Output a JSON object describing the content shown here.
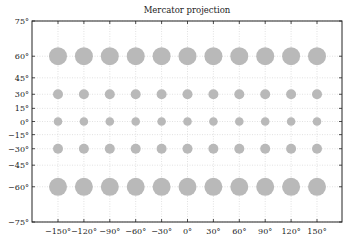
{
  "chart_data": {
    "type": "scatter",
    "title": "Mercator projection",
    "xlabel": "",
    "ylabel": "",
    "projection": "mercator",
    "xlim": [
      -180,
      180
    ],
    "ylim": [
      -75,
      75
    ],
    "grid": true,
    "grid_style": "dotted",
    "x_ticks": [
      -150,
      -120,
      -90,
      -60,
      -30,
      0,
      30,
      60,
      90,
      120,
      150
    ],
    "x_tick_labels": [
      "−150°",
      "−120°",
      "−90°",
      "−60°",
      "−30°",
      "0°",
      "30°",
      "60°",
      "90°",
      "120°",
      "150°"
    ],
    "y_ticks": [
      75,
      60,
      45,
      30,
      15,
      0,
      -15,
      -30,
      -45,
      -60,
      -75
    ],
    "y_tick_labels": [
      "75°",
      "60°",
      "45°",
      "30°",
      "15°",
      "0°",
      "−15°",
      "−30°",
      "−45°",
      "−60°",
      "−75°"
    ],
    "marker_color": "#b9b9b9",
    "series": [
      {
        "name": "lat 60",
        "lat": 60,
        "lons": [
          -150,
          -120,
          -90,
          -60,
          -30,
          0,
          30,
          60,
          90,
          120,
          150
        ],
        "relative_size": "large"
      },
      {
        "name": "lat 30",
        "lat": 30,
        "lons": [
          -150,
          -120,
          -90,
          -60,
          -30,
          0,
          30,
          60,
          90,
          120,
          150
        ],
        "relative_size": "small"
      },
      {
        "name": "lat 0",
        "lat": 0,
        "lons": [
          -150,
          -120,
          -90,
          -60,
          -30,
          0,
          30,
          60,
          90,
          120,
          150
        ],
        "relative_size": "smallest"
      },
      {
        "name": "lat -30",
        "lat": -30,
        "lons": [
          -150,
          -120,
          -90,
          -60,
          -30,
          0,
          30,
          60,
          90,
          120,
          150
        ],
        "relative_size": "small"
      },
      {
        "name": "lat -60",
        "lat": -60,
        "lons": [
          -150,
          -120,
          -90,
          -60,
          -30,
          0,
          30,
          60,
          90,
          120,
          150
        ],
        "relative_size": "large"
      }
    ],
    "legend": null
  }
}
